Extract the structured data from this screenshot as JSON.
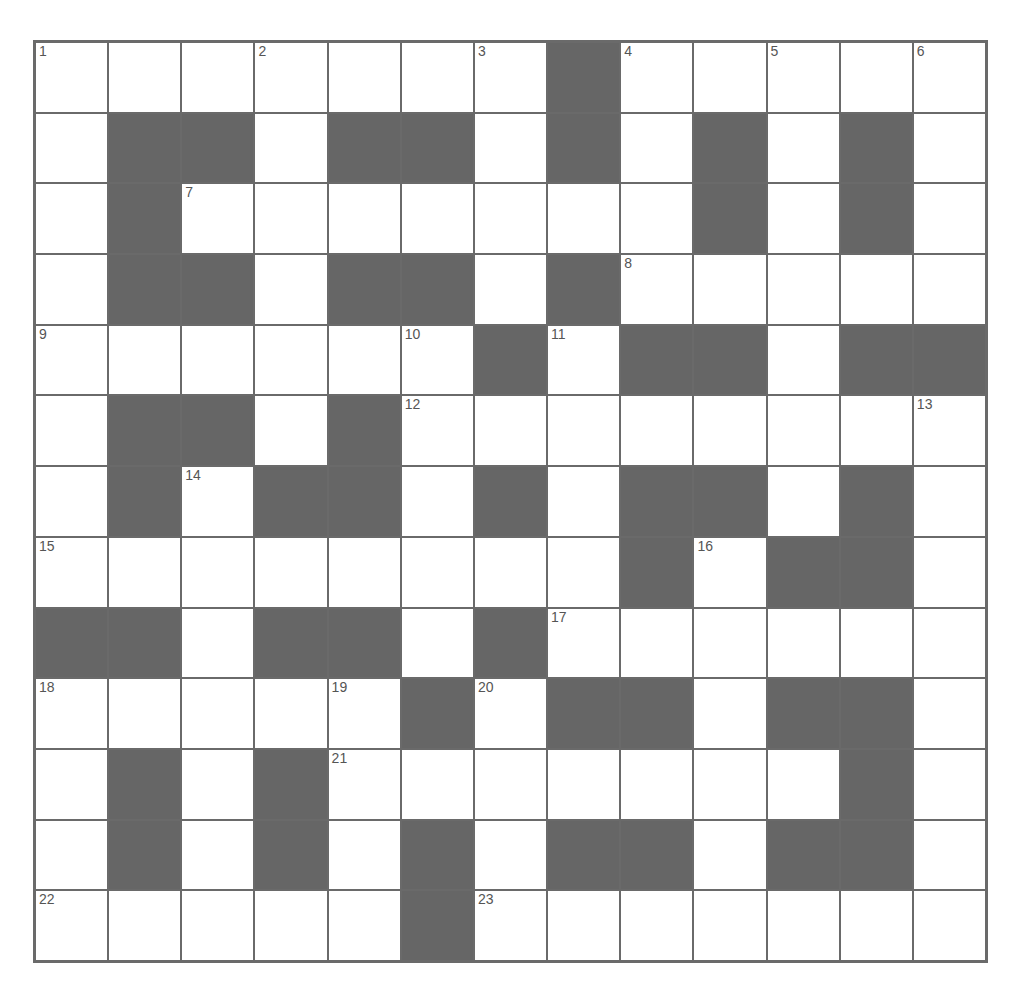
{
  "puzzle": {
    "type": "crossword",
    "size": {
      "rows": 13,
      "cols": 13
    },
    "colors": {
      "block": "#666666",
      "cell": "#ffffff",
      "line": "#6a6a6a",
      "number": "#555555"
    },
    "layout": [
      "WWWWWWWBWWWWW",
      "WBBWBBWBWBWBW",
      "WBWWWWWWWBWBW",
      "WBBWBBWBWWWWW",
      "WWWWWWBWBBWBB",
      "WBBWBWWWWWWWW",
      "WBWBBWBWBBWBW",
      "WWWWWWWWBWBBW",
      "BBWBBWBWWWWWW",
      "WWWWWBWBBWBBW",
      "WBWBWWWWWWWBW",
      "WBWBWBWBBWBBW",
      "WWWWWBWWWWWWW"
    ],
    "numbers": [
      {
        "r": 0,
        "c": 0,
        "n": "1"
      },
      {
        "r": 0,
        "c": 3,
        "n": "2"
      },
      {
        "r": 0,
        "c": 6,
        "n": "3"
      },
      {
        "r": 0,
        "c": 8,
        "n": "4"
      },
      {
        "r": 0,
        "c": 10,
        "n": "5"
      },
      {
        "r": 0,
        "c": 12,
        "n": "6"
      },
      {
        "r": 2,
        "c": 2,
        "n": "7"
      },
      {
        "r": 3,
        "c": 8,
        "n": "8"
      },
      {
        "r": 4,
        "c": 0,
        "n": "9"
      },
      {
        "r": 4,
        "c": 5,
        "n": "10"
      },
      {
        "r": 4,
        "c": 7,
        "n": "11"
      },
      {
        "r": 5,
        "c": 5,
        "n": "12"
      },
      {
        "r": 5,
        "c": 12,
        "n": "13"
      },
      {
        "r": 6,
        "c": 2,
        "n": "14"
      },
      {
        "r": 7,
        "c": 0,
        "n": "15"
      },
      {
        "r": 7,
        "c": 9,
        "n": "16"
      },
      {
        "r": 8,
        "c": 7,
        "n": "17"
      },
      {
        "r": 9,
        "c": 0,
        "n": "18"
      },
      {
        "r": 9,
        "c": 4,
        "n": "19"
      },
      {
        "r": 9,
        "c": 6,
        "n": "20"
      },
      {
        "r": 10,
        "c": 4,
        "n": "21"
      },
      {
        "r": 12,
        "c": 0,
        "n": "22"
      },
      {
        "r": 12,
        "c": 6,
        "n": "23"
      }
    ]
  }
}
